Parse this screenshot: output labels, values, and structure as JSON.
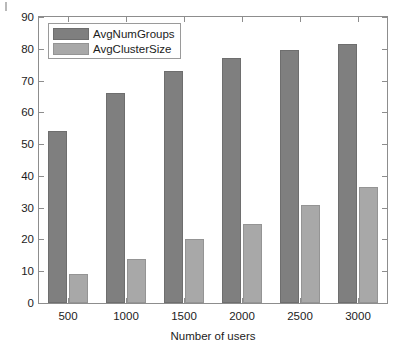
{
  "chart_data": {
    "type": "bar",
    "title": "",
    "subtitle": "",
    "xlabel": "Number of users",
    "ylabel": "",
    "categories": [
      "500",
      "1000",
      "1500",
      "2000",
      "2500",
      "3000"
    ],
    "series": [
      {
        "name": "AvgNumGroups",
        "color": "#7f7f7f",
        "values": [
          54,
          66,
          73,
          77,
          79.5,
          81.5
        ]
      },
      {
        "name": "AvgClusterSize",
        "color": "#a8a8a8",
        "values": [
          9,
          14,
          20,
          25,
          31,
          36.5
        ]
      }
    ],
    "ylim": [
      0,
      90
    ],
    "yticks": [
      0,
      10,
      20,
      30,
      40,
      50,
      60,
      70,
      80,
      90
    ],
    "ytick_labels": [
      "0",
      "10",
      "20",
      "30",
      "40",
      "50",
      "60",
      "70",
      "80",
      "90"
    ],
    "xtick_labels": [
      "500",
      "1000",
      "1500",
      "2000",
      "2500",
      "3000"
    ],
    "grid": false,
    "legend_position": "top-left",
    "legend_entries": [
      "AvgNumGroups",
      "AvgClusterSize"
    ],
    "axis_color": "#8d8d8d",
    "background": "#ffffff"
  },
  "figure": {
    "xaxis_title": "Number of users"
  }
}
